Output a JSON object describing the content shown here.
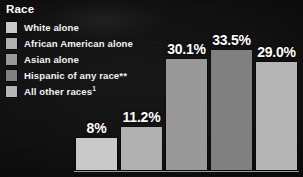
{
  "figure": {
    "background_color": "#0d0d0d",
    "baseline_color": "#b9b9b9"
  },
  "legend": {
    "title": "Race",
    "items": [
      {
        "label": "White alone",
        "color": "#c9c9c9"
      },
      {
        "label": "African American alone",
        "color": "#b0b0b0"
      },
      {
        "label": "Asian alone",
        "color": "#999999"
      },
      {
        "label": "Hispanic of any race**",
        "color": "#808080"
      },
      {
        "label": "All other races",
        "color": "#b5b5b5",
        "superscript": "1"
      }
    ]
  },
  "chart_data": {
    "type": "bar",
    "title": "Race",
    "xlabel": "",
    "ylabel": "",
    "grid": false,
    "legend_position": "top-left",
    "ylim": [
      0,
      40
    ],
    "categories": [
      "White alone",
      "African American alone",
      "Asian alone",
      "Hispanic of any race**",
      "All other races1"
    ],
    "values": [
      8,
      11.2,
      30.1,
      33.5,
      29.0
    ],
    "value_labels": [
      "8%",
      "11.2%",
      "30.1%",
      "33.5%",
      "29.0%"
    ],
    "colors": [
      "#c9c9c9",
      "#b0b0b0",
      "#999999",
      "#808080",
      "#b5b5b5"
    ],
    "bars": [
      {
        "label": "8%",
        "value": 8,
        "color": "#c9c9c9",
        "left": 76,
        "width": 41,
        "height": 32
      },
      {
        "label": "11.2%",
        "value": 11.2,
        "color": "#b0b0b0",
        "left": 121,
        "width": 41,
        "height": 43
      },
      {
        "label": "30.1%",
        "value": 30.1,
        "color": "#999999",
        "left": 166,
        "width": 41,
        "height": 111
      },
      {
        "label": "33.5%",
        "value": 33.5,
        "color": "#808080",
        "left": 211,
        "width": 41,
        "height": 120
      },
      {
        "label": "29.0%",
        "value": 29.0,
        "color": "#b5b5b5",
        "left": 256,
        "width": 41,
        "height": 108
      }
    ]
  }
}
